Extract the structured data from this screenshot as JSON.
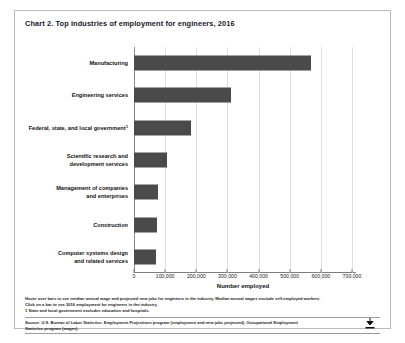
{
  "chart": {
    "title": "Chart 2. Top industries of employment for engineers, 2016",
    "xlabel": "Number employed",
    "notes": [
      "Hover over bars to see median annual wage and projected new jobs for engineers in the industry. Median annual wages exclude self-employed workers.",
      "Click on a bar to see 2016 employment for engineers in the industry.",
      "1 State and local government excludes education and hospitals."
    ],
    "source": [
      "Source: U.S. Bureau of Labor Statistics, Employment Projections program (employment and new jobs projected), Occupational Employment",
      "Statistics program (wages)."
    ],
    "download_icon": "download-icon"
  },
  "chart_data": {
    "type": "bar",
    "orientation": "horizontal",
    "title": "Chart 2. Top industries of employment for engineers, 2016",
    "xlabel": "Number employed",
    "ylabel": "",
    "xlim": [
      0,
      700000
    ],
    "grid": true,
    "legend": "none",
    "bar_color": "#4a4a4a",
    "tick_labels": [
      "0",
      "100,000",
      "200,000",
      "300,000",
      "400,000",
      "500,000",
      "600,000",
      "700,000"
    ],
    "tick_values": [
      0,
      100000,
      200000,
      300000,
      400000,
      500000,
      600000,
      700000
    ],
    "categories": [
      "Manufacturing",
      "Engineering services",
      "Federal, state, and local government",
      "Scientific research and development services",
      "Management of companies and enterprises",
      "Construction",
      "Computer systems design and related services"
    ],
    "category_labels": [
      {
        "line1": "Manufacturing",
        "line2": "",
        "footnote": ""
      },
      {
        "line1": "Engineering services",
        "line2": "",
        "footnote": ""
      },
      {
        "line1": "Federal, state, and local government",
        "line2": "",
        "footnote": "1"
      },
      {
        "line1": "Scientific research and",
        "line2": "development services",
        "footnote": ""
      },
      {
        "line1": "Management of companies",
        "line2": "and enterprises",
        "footnote": ""
      },
      {
        "line1": "Construction",
        "line2": "",
        "footnote": ""
      },
      {
        "line1": "Computer systems design",
        "line2": "and related services",
        "footnote": ""
      }
    ],
    "values": [
      567000,
      313000,
      183000,
      107000,
      77000,
      73000,
      72000
    ]
  }
}
